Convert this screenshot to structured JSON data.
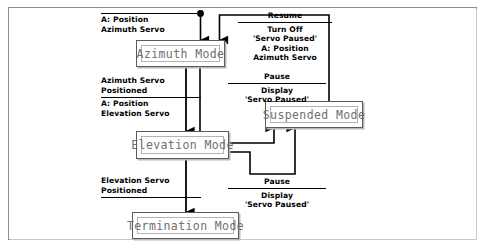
{
  "diagram": {
    "frame_color": "#8e8e8e",
    "box_border_color": "#5b5b5b",
    "box_text_color": "#6f6f6f",
    "line_color": "#000000"
  },
  "states": [
    {
      "id": "azimuth",
      "label": "Azimuth Mode"
    },
    {
      "id": "elevation",
      "label": "Elevation Mode"
    },
    {
      "id": "termination",
      "label": "Termination Mode"
    },
    {
      "id": "suspended",
      "label": "Suspended Mode"
    }
  ],
  "transitions": {
    "start_to_azimuth": {
      "trigger": "",
      "action_1": "A: Position",
      "action_2": "Azimuth Servo"
    },
    "azimuth_to_elevation": {
      "trigger_1": "Azimuth Servo",
      "trigger_2": "Positioned",
      "action_1": "A: Position",
      "action_2": "Elevation Servo"
    },
    "elevation_to_termination": {
      "trigger_1": "Elevation Servo",
      "trigger_2": "Positioned"
    },
    "azimuth_to_suspended": {
      "trigger": "Pause",
      "action_1": "Display",
      "action_2": "'Servo Paused'"
    },
    "elevation_to_suspended": {
      "trigger": "Pause",
      "action_1": "Display",
      "action_2": "'Servo Paused'"
    },
    "suspended_to_azimuth": {
      "trigger": "Resume",
      "action_1": "Turn Off",
      "action_2": "'Servo Paused'",
      "action_3": "A: Position",
      "action_4": "Azimuth Servo"
    }
  }
}
